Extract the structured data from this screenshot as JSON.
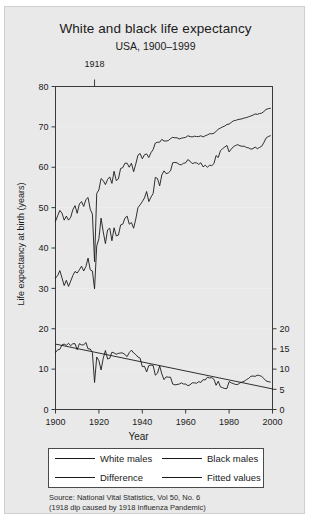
{
  "figure": {
    "title": "White and black life expectancy",
    "subtitle": "USA, 1900–1999",
    "background_color": "#e9e9e9",
    "plot_background_color": "#ffffff",
    "line_color": "#1a1a1a"
  },
  "annotation": {
    "label": "1918",
    "year": 1918
  },
  "legend": {
    "items": [
      {
        "label": "White males"
      },
      {
        "label": "Black males"
      },
      {
        "label": "Difference"
      },
      {
        "label": "Fitted values"
      }
    ]
  },
  "source": {
    "line1": "Source: National Vital Statistics, Vol 50, No. 6",
    "line2": "(1918 dip caused by 1918 Influenza Pandemic)"
  },
  "chart_data": {
    "type": "line",
    "title": "White and black life expectancy",
    "subtitle": "USA, 1900–1999",
    "xlabel": "Year",
    "ylabel": "Life expectancy at birth (years)",
    "ylabel_right": "",
    "xlim": [
      1900,
      2000
    ],
    "ylim": [
      0,
      80
    ],
    "ylim_right": [
      0,
      20
    ],
    "xticks": [
      1900,
      1920,
      1940,
      1960,
      1980,
      2000
    ],
    "yticks": [
      0,
      10,
      20,
      30,
      40,
      50,
      60,
      70,
      80
    ],
    "yticks_right": [
      0,
      5,
      10,
      15,
      20
    ],
    "grid": true,
    "legend_position": "below-axes",
    "annotations": [
      {
        "text": "1918",
        "x": 1918,
        "note": "1918 dip caused by 1918 Influenza Pandemic"
      }
    ],
    "x": [
      1900,
      1901,
      1902,
      1903,
      1904,
      1905,
      1906,
      1907,
      1908,
      1909,
      1910,
      1911,
      1912,
      1913,
      1914,
      1915,
      1916,
      1917,
      1918,
      1919,
      1920,
      1921,
      1922,
      1923,
      1924,
      1925,
      1926,
      1927,
      1928,
      1929,
      1930,
      1931,
      1932,
      1933,
      1934,
      1935,
      1936,
      1937,
      1938,
      1939,
      1940,
      1941,
      1942,
      1943,
      1944,
      1945,
      1946,
      1947,
      1948,
      1949,
      1950,
      1951,
      1952,
      1953,
      1954,
      1955,
      1956,
      1957,
      1958,
      1959,
      1960,
      1961,
      1962,
      1963,
      1964,
      1965,
      1966,
      1967,
      1968,
      1969,
      1970,
      1971,
      1972,
      1973,
      1974,
      1975,
      1976,
      1977,
      1978,
      1979,
      1980,
      1981,
      1982,
      1983,
      1984,
      1985,
      1986,
      1987,
      1988,
      1989,
      1990,
      1991,
      1992,
      1993,
      1994,
      1995,
      1996,
      1997,
      1998,
      1999
    ],
    "series": [
      {
        "name": "White males",
        "axis": "left",
        "values": [
          46.6,
          48.0,
          49.3,
          48.6,
          46.9,
          47.9,
          46.9,
          47.6,
          49.5,
          50.5,
          48.6,
          50.9,
          51.5,
          50.3,
          52.0,
          52.5,
          49.6,
          48.4,
          36.6,
          53.5,
          54.4,
          57.2,
          56.7,
          55.7,
          57.0,
          57.6,
          56.0,
          59.0,
          56.7,
          57.1,
          59.7,
          59.9,
          61.0,
          61.0,
          60.0,
          61.0,
          58.9,
          60.8,
          63.0,
          63.4,
          62.1,
          63.1,
          63.3,
          62.4,
          63.6,
          64.4,
          66.0,
          66.2,
          66.2,
          66.9,
          66.5,
          66.5,
          66.6,
          67.1,
          67.4,
          67.3,
          67.3,
          67.0,
          67.2,
          67.3,
          67.4,
          67.8,
          67.6,
          67.5,
          67.7,
          67.6,
          67.6,
          67.8,
          67.5,
          67.8,
          68.0,
          68.3,
          68.3,
          68.4,
          68.9,
          69.4,
          69.7,
          70.0,
          70.2,
          70.6,
          70.7,
          71.1,
          71.5,
          71.6,
          71.8,
          71.9,
          72.0,
          72.2,
          72.3,
          72.5,
          72.7,
          72.9,
          73.2,
          73.1,
          73.3,
          73.4,
          73.8,
          74.3,
          74.5,
          74.6
        ]
      },
      {
        "name": "Black males",
        "axis": "left",
        "values": [
          32.5,
          33.2,
          34.4,
          32.6,
          30.7,
          32.0,
          30.5,
          31.8,
          33.2,
          34.2,
          33.8,
          34.6,
          35.5,
          34.3,
          35.4,
          37.5,
          34.6,
          34.3,
          29.9,
          40.5,
          42.3,
          47.4,
          44.0,
          41.1,
          44.5,
          44.9,
          41.8,
          45.0,
          43.0,
          43.2,
          45.7,
          45.9,
          47.4,
          47.9,
          45.9,
          46.3,
          44.9,
          47.2,
          50.0,
          50.7,
          51.5,
          52.4,
          54.0,
          51.5,
          52.6,
          53.5,
          57.5,
          57.2,
          55.4,
          58.1,
          59.1,
          58.4,
          58.6,
          59.1,
          61.1,
          61.2,
          61.1,
          60.7,
          60.6,
          61.0,
          61.1,
          61.9,
          61.5,
          60.9,
          61.1,
          61.1,
          60.7,
          61.1,
          60.1,
          60.5,
          60.0,
          60.5,
          60.4,
          60.9,
          62.9,
          62.4,
          64.1,
          64.6,
          65.0,
          65.4,
          63.8,
          64.5,
          65.1,
          65.4,
          65.6,
          65.3,
          65.2,
          65.2,
          64.9,
          64.8,
          64.5,
          64.6,
          65.0,
          64.6,
          64.9,
          65.2,
          66.1,
          67.2,
          67.6,
          67.8
        ]
      },
      {
        "name": "Difference",
        "axis": "right",
        "values": [
          14.1,
          14.8,
          14.9,
          16.0,
          16.2,
          15.9,
          16.4,
          15.8,
          16.3,
          16.3,
          14.8,
          16.3,
          16.0,
          16.0,
          16.6,
          15.0,
          15.0,
          14.1,
          6.7,
          13.0,
          12.1,
          9.8,
          12.7,
          14.6,
          12.5,
          12.7,
          14.2,
          14.0,
          13.7,
          13.9,
          14.0,
          14.0,
          13.6,
          13.1,
          14.1,
          14.7,
          14.0,
          13.6,
          13.0,
          12.7,
          10.6,
          10.7,
          9.3,
          10.9,
          11.0,
          10.9,
          8.5,
          9.0,
          10.8,
          8.8,
          7.4,
          8.1,
          8.0,
          8.0,
          6.3,
          6.1,
          6.2,
          6.3,
          6.6,
          6.3,
          6.3,
          5.9,
          6.1,
          6.6,
          6.6,
          6.5,
          6.9,
          6.7,
          7.4,
          7.3,
          8.0,
          7.8,
          7.9,
          7.5,
          6.0,
          7.0,
          5.6,
          5.4,
          5.2,
          5.2,
          6.9,
          6.6,
          6.4,
          6.2,
          6.2,
          6.6,
          6.8,
          7.0,
          7.4,
          7.7,
          8.2,
          8.3,
          8.2,
          8.5,
          8.4,
          8.2,
          7.7,
          7.1,
          6.9,
          6.8
        ]
      },
      {
        "name": "Fitted values",
        "axis": "right",
        "values": [
          16.2,
          5.1
        ],
        "x": [
          1900,
          2000
        ],
        "kind": "linear-fit",
        "note": "straight regression line from about 16.2 in 1900 down to about 5.1 in 2000"
      }
    ]
  }
}
